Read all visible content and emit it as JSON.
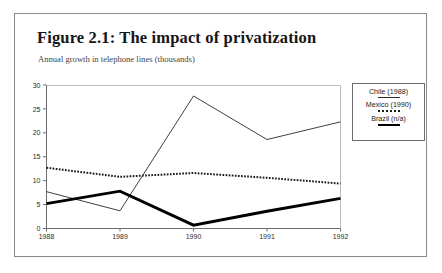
{
  "figure": {
    "title": "Figure 2.1:  The impact of privatization",
    "subtitle": "Annual growth in telephone lines (thousands)"
  },
  "legend": {
    "entries": [
      {
        "label": "Chile (1988)",
        "style": "thin"
      },
      {
        "label": "Mexico (1990)",
        "style": "dotted"
      },
      {
        "label": "Brazil (n/a)",
        "style": "thick"
      }
    ]
  },
  "axes": {
    "y_ticks": [
      "0",
      "5",
      "10",
      "15",
      "20",
      "25",
      "30"
    ],
    "x_ticks": [
      "1988",
      "1989",
      "1990",
      "1991",
      "1992"
    ]
  },
  "chart_data": {
    "type": "line",
    "title": "Figure 2.1:  The impact of privatization",
    "subtitle": "Annual growth in telephone lines (thousands)",
    "xlabel": "",
    "ylabel": "Annual growth in telephone lines (thousands)",
    "categories": [
      "1988",
      "1989",
      "1990",
      "1991",
      "1992"
    ],
    "ylim": [
      0,
      30
    ],
    "yticks": [
      0,
      5,
      10,
      15,
      20,
      25,
      30
    ],
    "grid": false,
    "legend_position": "right",
    "series": [
      {
        "name": "Chile (1988)",
        "style": "thin-solid",
        "color": "#2a2a2a",
        "values": [
          7.7,
          3.7,
          27.7,
          18.6,
          22.3
        ]
      },
      {
        "name": "Mexico (1990)",
        "style": "dotted",
        "color": "#1a1a1a",
        "values": [
          12.7,
          10.8,
          11.6,
          10.6,
          9.4
        ]
      },
      {
        "name": "Brazil (n/a)",
        "style": "thick-solid",
        "color": "#000000",
        "values": [
          5.2,
          7.8,
          0.7,
          3.6,
          6.3
        ]
      }
    ]
  }
}
